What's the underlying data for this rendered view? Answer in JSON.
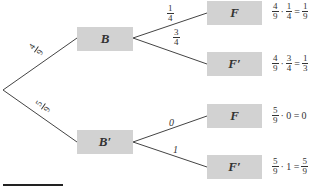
{
  "tree": {
    "root": {
      "x": 3,
      "y": 90
    },
    "level1": [
      {
        "id": "B",
        "label": "B",
        "branch_prob": {
          "num": "4",
          "den": "9"
        }
      },
      {
        "id": "Bc",
        "label": "B′",
        "branch_prob": {
          "num": "5",
          "den": "9"
        }
      }
    ],
    "level2": [
      {
        "parent": "B",
        "label": "F",
        "branch_prob": {
          "num": "1",
          "den": "4"
        },
        "result": {
          "a": {
            "num": "4",
            "den": "9"
          },
          "op": "·",
          "b": {
            "num": "1",
            "den": "4"
          },
          "eq": "=",
          "c": {
            "num": "1",
            "den": "9"
          }
        }
      },
      {
        "parent": "B",
        "label": "F′",
        "branch_prob": {
          "num": "3",
          "den": "4"
        },
        "result": {
          "a": {
            "num": "4",
            "den": "9"
          },
          "op": "·",
          "b": {
            "num": "3",
            "den": "4"
          },
          "eq": "=",
          "c": {
            "num": "1",
            "den": "3"
          }
        }
      },
      {
        "parent": "Bc",
        "label": "F",
        "branch_prob": {
          "value": "0"
        },
        "result": {
          "a": {
            "num": "5",
            "den": "9"
          },
          "op": "· 0 =",
          "c_plain": "0"
        }
      },
      {
        "parent": "Bc",
        "label": "F′",
        "branch_prob": {
          "value": "1"
        },
        "result": {
          "a": {
            "num": "5",
            "den": "9"
          },
          "op": "· 1 =",
          "c": {
            "num": "5",
            "den": "9"
          }
        }
      }
    ]
  },
  "colors": {
    "node_fill": "#d2d2d2",
    "edge": "#444444",
    "text": "#333333"
  }
}
